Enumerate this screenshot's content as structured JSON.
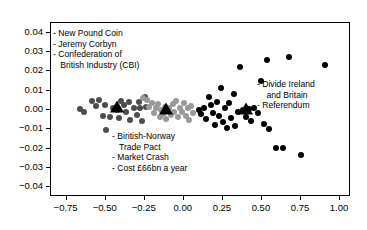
{
  "chart_data": {
    "type": "scatter",
    "title": "",
    "xlabel": "",
    "ylabel": "",
    "xlim": [
      -0.85,
      1.07
    ],
    "ylim": [
      -0.045,
      0.045
    ],
    "grid": false,
    "legend": "none",
    "xticks": [
      -0.75,
      -0.5,
      -0.25,
      0.0,
      0.25,
      0.5,
      0.75,
      1.0
    ],
    "xticklabels": [
      "−0.75",
      "−0.50",
      "−0.25",
      "0.00",
      "0.25",
      "0.50",
      "0.75",
      "1.00"
    ],
    "yticks": [
      -0.04,
      -0.03,
      -0.02,
      -0.01,
      0.0,
      0.01,
      0.02,
      0.03,
      0.04
    ],
    "yticklabels": [
      "−0.04",
      "−0.03",
      "−0.02",
      "−0.01",
      "0.00",
      "0.01",
      "0.02",
      "0.03",
      "0.04"
    ],
    "series": [
      {
        "name": "cluster-left",
        "color": "#4d4d4d",
        "marker": "circle",
        "points": [
          [
            -0.665,
            0.0005
          ],
          [
            -0.64,
            -0.001
          ],
          [
            -0.585,
            0.0048
          ],
          [
            -0.54,
            0.005
          ],
          [
            -0.56,
            0.0022
          ],
          [
            -0.505,
            0.0028
          ],
          [
            -0.5,
            -0.0105
          ],
          [
            -0.52,
            -0.003
          ],
          [
            -0.472,
            -0.0035
          ],
          [
            -0.455,
            0.0008
          ],
          [
            -0.43,
            0.0002
          ],
          [
            -0.415,
            -0.004
          ],
          [
            -0.4,
            0.0048
          ],
          [
            -0.38,
            0.0025
          ],
          [
            -0.372,
            -0.0008
          ],
          [
            -0.35,
            0.0042
          ],
          [
            -0.345,
            -0.005
          ],
          [
            -0.322,
            0.0012
          ],
          [
            -0.3,
            -0.0028
          ],
          [
            -0.29,
            0.004
          ],
          [
            -0.28,
            0.0008
          ],
          [
            -0.268,
            -0.0055
          ],
          [
            -0.25,
            0.0068
          ],
          [
            -0.245,
            0.0018
          ]
        ],
        "centroid": [
          -0.425,
          0.0008
        ]
      },
      {
        "name": "cluster-middle",
        "color": "#999999",
        "marker": "circle",
        "points": [
          [
            -0.26,
            0.0062
          ],
          [
            -0.238,
            0.005
          ],
          [
            -0.225,
            0.0015
          ],
          [
            -0.205,
            0.0035
          ],
          [
            -0.192,
            -0.0015
          ],
          [
            -0.18,
            0.001
          ],
          [
            -0.168,
            0.003
          ],
          [
            -0.155,
            -0.0038
          ],
          [
            -0.148,
            0.0002
          ],
          [
            -0.132,
            -0.0022
          ],
          [
            -0.12,
            0.0018
          ],
          [
            -0.112,
            -0.0048
          ],
          [
            -0.098,
            0.0008
          ],
          [
            -0.085,
            -0.0028
          ],
          [
            -0.072,
            0.003
          ],
          [
            -0.06,
            -0.0012
          ],
          [
            -0.048,
            0.0045
          ],
          [
            -0.035,
            -0.0038
          ],
          [
            -0.022,
            0.0012
          ],
          [
            -0.01,
            -0.0008
          ],
          [
            0.002,
            0.0035
          ],
          [
            0.012,
            -0.003
          ],
          [
            0.025,
            0.001
          ],
          [
            0.035,
            -0.0052
          ],
          [
            0.048,
            0.0022
          ],
          [
            0.058,
            -0.0018
          ]
        ],
        "centroid": [
          -0.115,
          -0.0002
        ]
      },
      {
        "name": "cluster-right",
        "color": "#000000",
        "marker": "circle",
        "points": [
          [
            0.095,
            0.0002
          ],
          [
            0.108,
            -0.0022
          ],
          [
            0.128,
            0.0012
          ],
          [
            0.142,
            -0.0048
          ],
          [
            0.16,
            0.0068
          ],
          [
            0.175,
            0.0025
          ],
          [
            0.188,
            -0.0015
          ],
          [
            0.2,
            -0.0078
          ],
          [
            0.215,
            0.0042
          ],
          [
            0.228,
            -0.0032
          ],
          [
            0.238,
            0.0112
          ],
          [
            0.252,
            -0.0062
          ],
          [
            0.265,
            0.0008
          ],
          [
            0.278,
            -0.0092
          ],
          [
            0.292,
            0.0035
          ],
          [
            0.305,
            -0.0042
          ],
          [
            0.318,
            0.0082
          ],
          [
            0.33,
            -0.0082
          ],
          [
            0.345,
            -0.0012
          ],
          [
            0.362,
            0.0225
          ],
          [
            0.38,
            0.0002
          ],
          [
            0.398,
            -0.0035
          ],
          [
            0.418,
            0.0005
          ],
          [
            0.432,
            -0.0058
          ],
          [
            0.452,
            0.0012
          ],
          [
            0.472,
            -0.0015
          ],
          [
            0.492,
            0.0152
          ],
          [
            0.512,
            -0.007
          ],
          [
            0.53,
            0.0258
          ],
          [
            0.548,
            -0.0098
          ],
          [
            0.592,
            -0.0198
          ],
          [
            0.635,
            -0.0198
          ],
          [
            0.672,
            0.0272
          ],
          [
            0.752,
            -0.0232
          ],
          [
            0.905,
            0.0232
          ]
        ],
        "centroid": [
          0.398,
          0.0
        ]
      }
    ],
    "annotations": [
      {
        "name": "annotation-top-left",
        "lines": [
          "- New Pound Coin",
          "- Jeremy Corbyn",
          "- Confederation of",
          "   British Industry (CBI)"
        ],
        "x": 53,
        "y": 28
      },
      {
        "name": "annotation-bottom-left",
        "lines": [
          "- Biritish-Norway",
          "   Trade Pact",
          "- Market Crash",
          "- Cost £66bn a year"
        ],
        "x": 112,
        "y": 131
      },
      {
        "name": "annotation-right",
        "lines": [
          "- Divide Ireland",
          "    and Britain",
          "- Referendum"
        ],
        "x": 257,
        "y": 79
      }
    ]
  }
}
